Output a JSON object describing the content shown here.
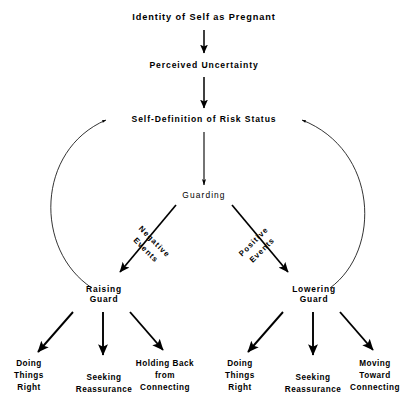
{
  "diagram": {
    "title": "Identity of Self as Pregnant",
    "background_color": "#ffffff",
    "line_color": "#000000",
    "nodes": {
      "identity": "Identity of Self as Pregnant",
      "uncertainty": "Perceived Uncertainty",
      "self_definition": "Self-Definition of Risk Status",
      "guarding": "Guarding",
      "raising_guard": "Raising\nGuard",
      "lowering_guard": "Lowering\nGuard",
      "left_leaf_1": "Doing\nThings\nRight",
      "left_leaf_2": "Seeking\nReassurance",
      "left_leaf_3": "Holding Back\nfrom\nConnecting",
      "right_leaf_1": "Doing\nThings\nRight",
      "right_leaf_2": "Seeking\nReassurance",
      "right_leaf_3": "Moving\nToward\nConnecting"
    },
    "edge_labels": {
      "negative_events": "Negative\nEvents",
      "positive_events": "Positive\nEvents"
    }
  }
}
